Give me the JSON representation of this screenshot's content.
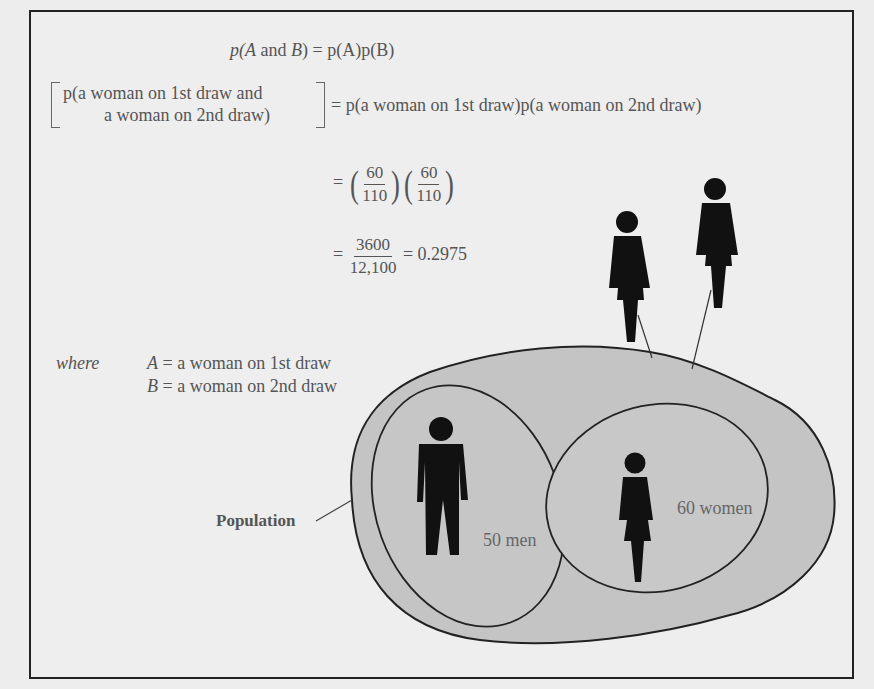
{
  "equations": {
    "line1": {
      "lhs_prefix": "p(",
      "lhs_A": "A",
      "lhs_and": " and ",
      "lhs_B": "B",
      "rhs": ") = p(A)p(B)"
    },
    "line2": {
      "bracket_line1": "p(a woman on 1st draw and",
      "bracket_line2": "a woman on 2nd draw)",
      "rhs": "= p(a woman on 1st draw)p(a woman on 2nd draw)"
    },
    "line3": {
      "eq": "=",
      "frac1": {
        "num": "60",
        "den": "110"
      },
      "frac2": {
        "num": "60",
        "den": "110"
      }
    },
    "line4": {
      "eq": "=",
      "frac": {
        "num": "3600",
        "den": "12,100"
      },
      "result": "= 0.2975"
    }
  },
  "definitions": {
    "where_label": "where",
    "A_var": "A",
    "A_def": " = a woman on 1st draw",
    "B_var": "B",
    "B_def": " = a woman on 2nd draw"
  },
  "diagram": {
    "population_label": "Population",
    "men_label": "50 men",
    "women_label": "60 women",
    "drawn_figures": [
      "woman",
      "woman"
    ],
    "colors": {
      "population_fill": "#c4c4c4",
      "figure": "#111111",
      "outline": "#222222",
      "background": "#eeeeee"
    }
  }
}
